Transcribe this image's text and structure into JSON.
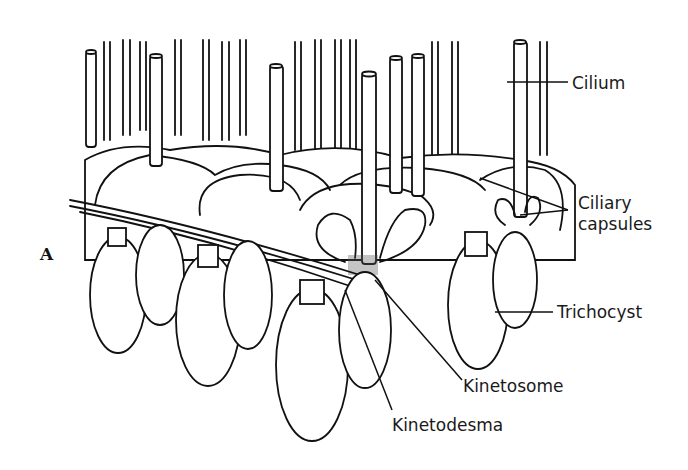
{
  "figure": {
    "panel_letter": "A",
    "labels": [
      {
        "id": "cilium",
        "text": "Cilium"
      },
      {
        "id": "ciliary-capsules-1",
        "text": "Ciliary"
      },
      {
        "id": "ciliary-capsules-2",
        "text": "capsules"
      },
      {
        "id": "trichocyst",
        "text": "Trichocyst"
      },
      {
        "id": "kinetosome",
        "text": "Kinetosome"
      },
      {
        "id": "kinetodesma",
        "text": "Kinetodesma"
      }
    ]
  }
}
